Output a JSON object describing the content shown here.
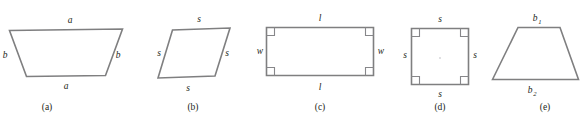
{
  "figure": {
    "background_color": "#ffffff",
    "stroke_color": "#7f7f80",
    "text_color": "#231f20",
    "panels": [
      {
        "id": "a",
        "caption": "(a)",
        "shape_name": "parallelogram",
        "labels": {
          "top": "a",
          "bottom": "a",
          "left": "b",
          "right": "b"
        }
      },
      {
        "id": "b",
        "caption": "(b)",
        "shape_name": "rhombus",
        "labels": {
          "top": "s",
          "bottom": "s",
          "left": "s",
          "right": "s"
        }
      },
      {
        "id": "c",
        "caption": "(c)",
        "shape_name": "rectangle",
        "labels": {
          "top": "l",
          "bottom": "l",
          "left": "w",
          "right": "w"
        },
        "right_angle_marks": 4
      },
      {
        "id": "d",
        "caption": "(d)",
        "shape_name": "square",
        "labels": {
          "top": "s",
          "bottom": "s",
          "left": "s",
          "right": "s"
        },
        "right_angle_marks": 4
      },
      {
        "id": "e",
        "caption": "(e)",
        "shape_name": "trapezoid",
        "labels": {
          "top": "b",
          "top_sub": "1",
          "bottom": "b",
          "bottom_sub": "2"
        }
      }
    ]
  }
}
